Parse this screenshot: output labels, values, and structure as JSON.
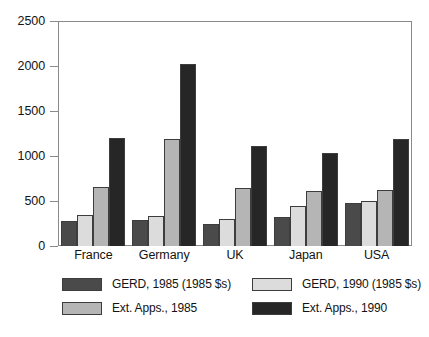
{
  "chart_data": {
    "type": "bar",
    "title": "",
    "subtitle": "",
    "xlabel": "",
    "ylabel": "",
    "ylim": [
      0,
      2500
    ],
    "yticks": [
      0,
      500,
      1000,
      1500,
      2000,
      2500
    ],
    "ytick_labels": [
      "0",
      "500",
      "1000",
      "1500",
      "2000",
      "2500"
    ],
    "grid": false,
    "legend_position": "below-plot",
    "categories": [
      "France",
      "Germany",
      "UK",
      "Japan",
      "USA"
    ],
    "series": [
      {
        "name": "GERD, 1985 (1985 $s)",
        "color": "#4a4a4a",
        "values": [
          275,
          285,
          250,
          320,
          480
        ]
      },
      {
        "name": "GERD, 1990 (1985 $s)",
        "color": "#dcdcdc",
        "values": [
          345,
          335,
          295,
          440,
          500
        ]
      },
      {
        "name": "Ext. Apps., 1985",
        "color": "#b5b5b5",
        "values": [
          660,
          1185,
          645,
          610,
          620
        ]
      },
      {
        "name": "Ext. Apps., 1990",
        "color": "#262626",
        "values": [
          1200,
          2025,
          1110,
          1035,
          1185
        ]
      }
    ]
  },
  "legend": {
    "entries": [
      {
        "label": "GERD, 1985 (1985 $s)",
        "color": "#4a4a4a"
      },
      {
        "label": "GERD, 1990 (1985 $s)",
        "color": "#dcdcdc"
      },
      {
        "label": "Ext. Apps., 1985",
        "color": "#b5b5b5"
      },
      {
        "label": "Ext. Apps., 1990",
        "color": "#262626"
      }
    ]
  },
  "axis": {
    "tick_color": "#8a8a8a",
    "frame_color": "#8a8a8a"
  }
}
